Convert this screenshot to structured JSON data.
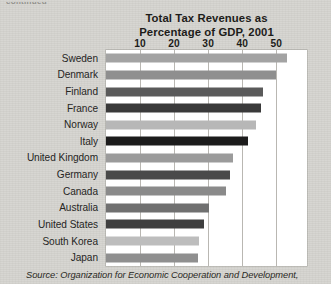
{
  "page": {
    "cutoff_text": "continued",
    "background_color": "#d7d6d2"
  },
  "source_note": "Source: Organization for Economic Cooperation and Development,",
  "chart_data": {
    "type": "bar",
    "orientation": "horizontal",
    "title": "Total Tax Revenues as\nPercentage of GDP, 2001",
    "title_line1": "Total Tax Revenues as",
    "title_line2": "Percentage of GDP, 2001",
    "xlabel": "",
    "ylabel": "",
    "xlim": [
      0,
      59
    ],
    "xticks": [
      10,
      20,
      30,
      40,
      50
    ],
    "xtick_labels": [
      "10",
      "20",
      "30",
      "40",
      "50"
    ],
    "grid": "vertical",
    "legend": "none",
    "axis_position": "top",
    "categories": [
      "Sweden",
      "Denmark",
      "Finland",
      "France",
      "Norway",
      "Italy",
      "United Kingdom",
      "Germany",
      "Canada",
      "Australia",
      "United States",
      "South Korea",
      "Japan"
    ],
    "values": [
      53.2,
      49.8,
      46.1,
      45.4,
      44.0,
      41.8,
      37.4,
      36.4,
      35.2,
      30.1,
      28.9,
      27.2,
      27.1
    ],
    "bar_colors": [
      "#a3a3a3",
      "#8f8f8f",
      "#5a5a5a",
      "#3a3a3a",
      "#b7b7b7",
      "#1c1c1c",
      "#9b9b9b",
      "#4a4a4a",
      "#8a8a8a",
      "#707070",
      "#3f3f3f",
      "#bdbdbd",
      "#8f8f8f"
    ],
    "plot_background": "#ffffff",
    "gridline_color": "#b9b7b2"
  }
}
